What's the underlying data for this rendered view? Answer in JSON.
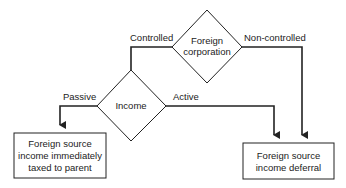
{
  "diagram": {
    "type": "flowchart",
    "colors": {
      "stroke": "#222222",
      "background": "#ffffff",
      "text": "#222222"
    },
    "nodes": {
      "foreign_corporation": {
        "shape": "diamond",
        "lines": [
          "Foreign",
          "corporation"
        ]
      },
      "income": {
        "shape": "diamond",
        "lines": [
          "Income"
        ]
      },
      "taxed_box": {
        "shape": "rectangle",
        "lines": [
          "Foreign source",
          "income immediately",
          "taxed to parent"
        ]
      },
      "deferral_box": {
        "shape": "rectangle",
        "lines": [
          "Foreign source",
          "income deferral"
        ]
      }
    },
    "edges": {
      "controlled": {
        "from": "foreign_corporation",
        "to": "income",
        "label": "Controlled"
      },
      "non_controlled": {
        "from": "foreign_corporation",
        "to": "deferral_box",
        "label": "Non-controlled"
      },
      "passive": {
        "from": "income",
        "to": "taxed_box",
        "label": "Passive"
      },
      "active": {
        "from": "income",
        "to": "deferral_box",
        "label": "Active"
      }
    }
  }
}
